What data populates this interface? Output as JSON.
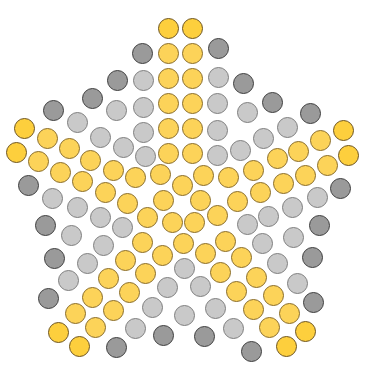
{
  "title": "Star pattern of colored pegs",
  "colors": {
    "yellow": "#fcd359",
    "gold": "#fdcf3d",
    "gray": "#c9c9c9",
    "dark": "#9a9a9a",
    "background": "#ffffff"
  },
  "pieces": [
    {
      "x": 168,
      "y": 28,
      "c": "gold"
    },
    {
      "x": 192,
      "y": 28,
      "c": "gold"
    },
    {
      "x": 142,
      "y": 53,
      "c": "dark"
    },
    {
      "x": 168,
      "y": 53,
      "c": "yellow"
    },
    {
      "x": 192,
      "y": 53,
      "c": "yellow"
    },
    {
      "x": 218,
      "y": 48,
      "c": "dark"
    },
    {
      "x": 117,
      "y": 80,
      "c": "dark"
    },
    {
      "x": 143,
      "y": 80,
      "c": "gray"
    },
    {
      "x": 168,
      "y": 78,
      "c": "yellow"
    },
    {
      "x": 192,
      "y": 78,
      "c": "yellow"
    },
    {
      "x": 218,
      "y": 77,
      "c": "gray"
    },
    {
      "x": 243,
      "y": 83,
      "c": "dark"
    },
    {
      "x": 92,
      "y": 98,
      "c": "dark"
    },
    {
      "x": 116,
      "y": 110,
      "c": "gray"
    },
    {
      "x": 143,
      "y": 107,
      "c": "gray"
    },
    {
      "x": 168,
      "y": 103,
      "c": "yellow"
    },
    {
      "x": 192,
      "y": 103,
      "c": "yellow"
    },
    {
      "x": 217,
      "y": 103,
      "c": "gray"
    },
    {
      "x": 247,
      "y": 112,
      "c": "gray"
    },
    {
      "x": 272,
      "y": 102,
      "c": "dark"
    },
    {
      "x": 53,
      "y": 110,
      "c": "dark"
    },
    {
      "x": 77,
      "y": 122,
      "c": "gray"
    },
    {
      "x": 100,
      "y": 137,
      "c": "gray"
    },
    {
      "x": 143,
      "y": 132,
      "c": "gray"
    },
    {
      "x": 168,
      "y": 128,
      "c": "yellow"
    },
    {
      "x": 192,
      "y": 128,
      "c": "yellow"
    },
    {
      "x": 217,
      "y": 130,
      "c": "gray"
    },
    {
      "x": 263,
      "y": 138,
      "c": "gray"
    },
    {
      "x": 287,
      "y": 127,
      "c": "gray"
    },
    {
      "x": 310,
      "y": 113,
      "c": "dark"
    },
    {
      "x": 24,
      "y": 128,
      "c": "gold"
    },
    {
      "x": 47,
      "y": 138,
      "c": "yellow"
    },
    {
      "x": 69,
      "y": 148,
      "c": "yellow"
    },
    {
      "x": 123,
      "y": 147,
      "c": "gray"
    },
    {
      "x": 145,
      "y": 156,
      "c": "gray"
    },
    {
      "x": 168,
      "y": 153,
      "c": "yellow"
    },
    {
      "x": 192,
      "y": 153,
      "c": "yellow"
    },
    {
      "x": 217,
      "y": 155,
      "c": "gray"
    },
    {
      "x": 240,
      "y": 150,
      "c": "gray"
    },
    {
      "x": 277,
      "y": 158,
      "c": "yellow"
    },
    {
      "x": 298,
      "y": 151,
      "c": "yellow"
    },
    {
      "x": 320,
      "y": 140,
      "c": "yellow"
    },
    {
      "x": 343,
      "y": 130,
      "c": "gold"
    },
    {
      "x": 16,
      "y": 152,
      "c": "gold"
    },
    {
      "x": 38,
      "y": 161,
      "c": "yellow"
    },
    {
      "x": 90,
      "y": 160,
      "c": "yellow"
    },
    {
      "x": 113,
      "y": 170,
      "c": "yellow"
    },
    {
      "x": 135,
      "y": 177,
      "c": "yellow"
    },
    {
      "x": 160,
      "y": 174,
      "c": "yellow"
    },
    {
      "x": 182,
      "y": 185,
      "c": "yellow"
    },
    {
      "x": 203,
      "y": 175,
      "c": "yellow"
    },
    {
      "x": 228,
      "y": 177,
      "c": "yellow"
    },
    {
      "x": 253,
      "y": 170,
      "c": "yellow"
    },
    {
      "x": 305,
      "y": 175,
      "c": "yellow"
    },
    {
      "x": 327,
      "y": 165,
      "c": "yellow"
    },
    {
      "x": 348,
      "y": 155,
      "c": "gold"
    },
    {
      "x": 60,
      "y": 172,
      "c": "yellow"
    },
    {
      "x": 82,
      "y": 181,
      "c": "yellow"
    },
    {
      "x": 105,
      "y": 192,
      "c": "yellow"
    },
    {
      "x": 127,
      "y": 203,
      "c": "yellow"
    },
    {
      "x": 163,
      "y": 200,
      "c": "yellow"
    },
    {
      "x": 200,
      "y": 200,
      "c": "yellow"
    },
    {
      "x": 237,
      "y": 201,
      "c": "yellow"
    },
    {
      "x": 260,
      "y": 192,
      "c": "yellow"
    },
    {
      "x": 283,
      "y": 183,
      "c": "yellow"
    },
    {
      "x": 28,
      "y": 185,
      "c": "dark"
    },
    {
      "x": 52,
      "y": 198,
      "c": "gray"
    },
    {
      "x": 77,
      "y": 207,
      "c": "gray"
    },
    {
      "x": 100,
      "y": 217,
      "c": "gray"
    },
    {
      "x": 147,
      "y": 217,
      "c": "yellow"
    },
    {
      "x": 172,
      "y": 222,
      "c": "yellow"
    },
    {
      "x": 194,
      "y": 222,
      "c": "yellow"
    },
    {
      "x": 217,
      "y": 215,
      "c": "yellow"
    },
    {
      "x": 292,
      "y": 207,
      "c": "gray"
    },
    {
      "x": 317,
      "y": 197,
      "c": "gray"
    },
    {
      "x": 340,
      "y": 188,
      "c": "dark"
    },
    {
      "x": 45,
      "y": 225,
      "c": "dark"
    },
    {
      "x": 71,
      "y": 235,
      "c": "gray"
    },
    {
      "x": 122,
      "y": 227,
      "c": "gray"
    },
    {
      "x": 247,
      "y": 224,
      "c": "gray"
    },
    {
      "x": 268,
      "y": 216,
      "c": "gray"
    },
    {
      "x": 319,
      "y": 225,
      "c": "dark"
    },
    {
      "x": 103,
      "y": 245,
      "c": "gray"
    },
    {
      "x": 142,
      "y": 242,
      "c": "yellow"
    },
    {
      "x": 183,
      "y": 243,
      "c": "yellow"
    },
    {
      "x": 225,
      "y": 241,
      "c": "yellow"
    },
    {
      "x": 262,
      "y": 243,
      "c": "gray"
    },
    {
      "x": 293,
      "y": 237,
      "c": "gray"
    },
    {
      "x": 54,
      "y": 258,
      "c": "dark"
    },
    {
      "x": 87,
      "y": 263,
      "c": "gray"
    },
    {
      "x": 125,
      "y": 260,
      "c": "yellow"
    },
    {
      "x": 162,
      "y": 255,
      "c": "yellow"
    },
    {
      "x": 205,
      "y": 253,
      "c": "yellow"
    },
    {
      "x": 241,
      "y": 257,
      "c": "yellow"
    },
    {
      "x": 277,
      "y": 263,
      "c": "gray"
    },
    {
      "x": 312,
      "y": 257,
      "c": "dark"
    },
    {
      "x": 68,
      "y": 280,
      "c": "gray"
    },
    {
      "x": 108,
      "y": 278,
      "c": "yellow"
    },
    {
      "x": 145,
      "y": 273,
      "c": "yellow"
    },
    {
      "x": 184,
      "y": 268,
      "c": "gray"
    },
    {
      "x": 220,
      "y": 272,
      "c": "yellow"
    },
    {
      "x": 256,
      "y": 277,
      "c": "yellow"
    },
    {
      "x": 297,
      "y": 283,
      "c": "gray"
    },
    {
      "x": 48,
      "y": 298,
      "c": "dark"
    },
    {
      "x": 92,
      "y": 297,
      "c": "yellow"
    },
    {
      "x": 129,
      "y": 292,
      "c": "yellow"
    },
    {
      "x": 167,
      "y": 287,
      "c": "gray"
    },
    {
      "x": 200,
      "y": 286,
      "c": "gray"
    },
    {
      "x": 236,
      "y": 291,
      "c": "yellow"
    },
    {
      "x": 273,
      "y": 295,
      "c": "yellow"
    },
    {
      "x": 313,
      "y": 302,
      "c": "dark"
    },
    {
      "x": 75,
      "y": 313,
      "c": "yellow"
    },
    {
      "x": 113,
      "y": 310,
      "c": "yellow"
    },
    {
      "x": 152,
      "y": 307,
      "c": "gray"
    },
    {
      "x": 184,
      "y": 315,
      "c": "gray"
    },
    {
      "x": 215,
      "y": 308,
      "c": "gray"
    },
    {
      "x": 253,
      "y": 309,
      "c": "yellow"
    },
    {
      "x": 289,
      "y": 313,
      "c": "yellow"
    },
    {
      "x": 58,
      "y": 332,
      "c": "gold"
    },
    {
      "x": 95,
      "y": 327,
      "c": "yellow"
    },
    {
      "x": 135,
      "y": 328,
      "c": "gray"
    },
    {
      "x": 163,
      "y": 335,
      "c": "dark"
    },
    {
      "x": 204,
      "y": 336,
      "c": "dark"
    },
    {
      "x": 233,
      "y": 328,
      "c": "gray"
    },
    {
      "x": 269,
      "y": 327,
      "c": "yellow"
    },
    {
      "x": 305,
      "y": 331,
      "c": "gold"
    },
    {
      "x": 79,
      "y": 346,
      "c": "gold"
    },
    {
      "x": 116,
      "y": 347,
      "c": "dark"
    },
    {
      "x": 251,
      "y": 351,
      "c": "dark"
    },
    {
      "x": 286,
      "y": 346,
      "c": "gold"
    }
  ]
}
